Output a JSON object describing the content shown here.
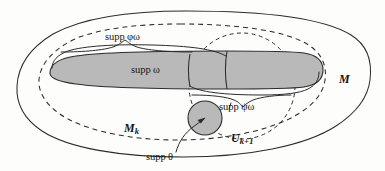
{
  "figure": {
    "kind": "mathematical-set-diagram",
    "background_color": "#fdfdfb",
    "line_color": "#2b2b2b",
    "shade_color": "#b9b9b9"
  },
  "labels": {
    "supp_phi_omega": "supp φω",
    "supp_omega": "supp ω",
    "supp_psi_omega": "supp ψω",
    "supp_theta": "supp θ",
    "manifold_M": "M",
    "manifold_Mk_base": "M",
    "manifold_Mk_sub": "k",
    "open_set_U_base": "U",
    "open_set_U_sub": "k+1"
  },
  "regions": [
    {
      "name": "outer-manifold",
      "label": "M",
      "style": "solid",
      "shape": "ellipse-irregular",
      "filled": false
    },
    {
      "name": "compact-exhaustion-Mk",
      "label": "Mk",
      "style": "dashed",
      "shape": "ellipse",
      "filled": false
    },
    {
      "name": "open-cover-Uk1",
      "label": "Uk+1",
      "style": "dashed",
      "shape": "circle",
      "filled": false
    },
    {
      "name": "support-omega",
      "label": "supp ω",
      "style": "solid",
      "shape": "rounded-blob",
      "filled": true,
      "fill": "#b9b9b9"
    },
    {
      "name": "support-theta",
      "label": "supp θ",
      "style": "solid",
      "shape": "circle",
      "filled": true,
      "fill": "#b9b9b9"
    },
    {
      "name": "support-phi-omega",
      "label": "supp φω",
      "style": "solid-brace",
      "shape": "brace-upper",
      "filled": false
    },
    {
      "name": "support-psi-omega",
      "label": "supp ψω",
      "style": "solid-brace",
      "shape": "brace-lower",
      "filled": false
    }
  ]
}
